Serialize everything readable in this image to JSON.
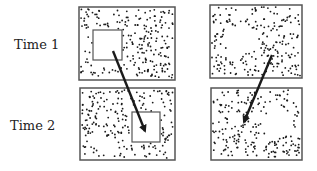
{
  "diagram": {
    "row_labels": [
      "Time 1",
      "Time 2"
    ],
    "panels": [
      {
        "id": "left-time1",
        "x": 79,
        "y": 7,
        "w": 96,
        "h": 73,
        "hole": {
          "type": "outlined-square",
          "x": 93,
          "y": 30,
          "w": 29,
          "h": 30
        }
      },
      {
        "id": "left-time2",
        "x": 80,
        "y": 88,
        "w": 95,
        "h": 72,
        "hole": {
          "type": "outlined-square",
          "x": 132,
          "y": 112,
          "w": 28,
          "h": 30
        }
      },
      {
        "id": "right-time1",
        "x": 210,
        "y": 5,
        "w": 92,
        "h": 73,
        "hole": {
          "type": "blank-region",
          "cx": 240,
          "cy": 40,
          "r": 15
        }
      },
      {
        "id": "right-time2",
        "x": 211,
        "y": 88,
        "w": 91,
        "h": 72,
        "hole": {
          "type": "blank-region",
          "cx": 278,
          "cy": 123,
          "r": 15
        }
      }
    ],
    "arrows": [
      {
        "id": "left-arrow",
        "from": [
          113,
          51
        ],
        "to": [
          145,
          131
        ]
      },
      {
        "id": "right-arrow",
        "from": [
          272,
          55
        ],
        "to": [
          244,
          122
        ]
      }
    ],
    "colors": {
      "ink": "#1a1a1a",
      "border": "#555555",
      "background": "#ffffff"
    }
  }
}
